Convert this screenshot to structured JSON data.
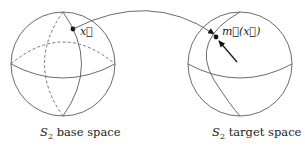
{
  "diagram": {
    "left_sphere": {
      "caption_symbol": "S",
      "caption_subscript": "2",
      "caption_text": " base space",
      "point_label": "x⃗"
    },
    "right_sphere": {
      "caption_symbol": "S",
      "caption_subscript": "2",
      "caption_text": " target space",
      "point_label": "m⃗(x⃗)"
    },
    "mapping_arrow": {
      "from": "x⃗",
      "to": "m⃗(x⃗)"
    },
    "colors": {
      "line": "#5a5a5a",
      "point": "#111111",
      "text": "#222222"
    }
  }
}
